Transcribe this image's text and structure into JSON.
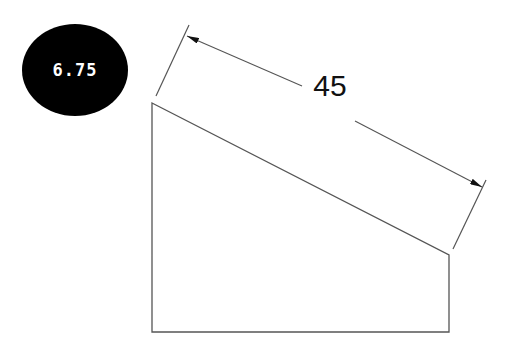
{
  "badge": {
    "value": "6.75",
    "background": "#000000",
    "text_color": "#ffffff"
  },
  "drawing": {
    "shape": "trapezoid",
    "line_color": "#555555",
    "vertices": [
      [
        152,
        103
      ],
      [
        449,
        255
      ],
      [
        449,
        332
      ],
      [
        152,
        332
      ]
    ],
    "dimension": {
      "label": "45",
      "label_position": [
        330,
        94
      ],
      "start_arrow_tip": [
        187,
        36
      ],
      "end_arrow_tip": [
        482,
        187
      ],
      "extension_lines": [
        {
          "from": [
            156,
            96
          ],
          "to": [
            189,
            25
          ]
        },
        {
          "from": [
            453,
            249
          ],
          "to": [
            486,
            180
          ]
        }
      ]
    }
  }
}
